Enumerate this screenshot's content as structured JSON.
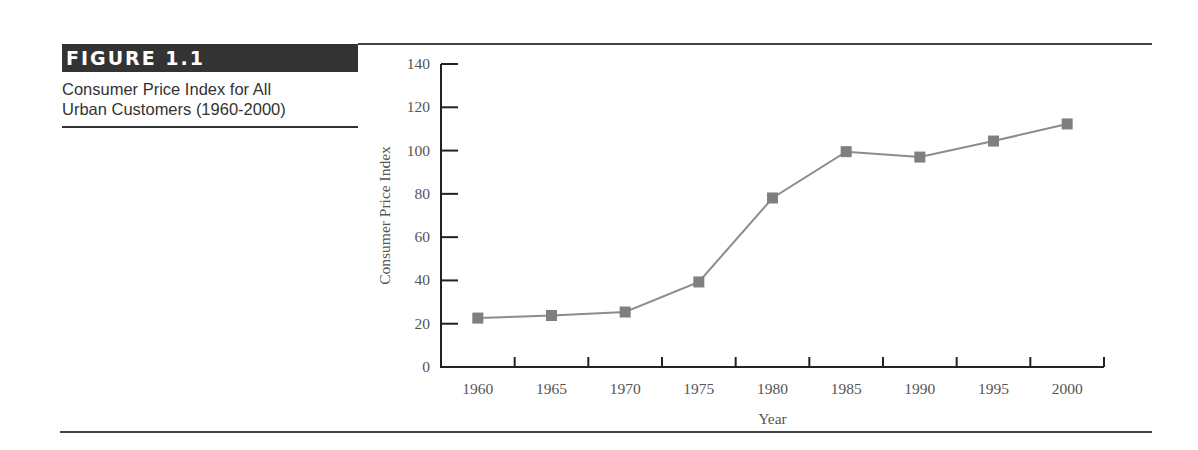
{
  "figure": {
    "label": "FIGURE 1.1",
    "caption_line1": "Consumer Price Index for All",
    "caption_line2": "Urban Customers (1960-2000)"
  },
  "colors": {
    "marker": "#7f7f7f",
    "line": "#8c8c8c",
    "axis": "#222222",
    "label_bar": "#333333"
  },
  "chart_data": {
    "type": "line",
    "title": "Consumer Price Index for All Urban Customers (1960-2000)",
    "xlabel": "Year",
    "ylabel": "Consumer Price Index",
    "categories": [
      "1960",
      "1965",
      "1970",
      "1975",
      "1980",
      "1985",
      "1990",
      "1995",
      "2000"
    ],
    "series": [
      {
        "name": "Consumer Price Index",
        "values": [
          22.6,
          23.8,
          25.4,
          39.3,
          78.1,
          99.5,
          97.0,
          104.4,
          112.3
        ],
        "marker": "square"
      }
    ],
    "ylim": [
      0,
      140
    ],
    "yticks": [
      0,
      20,
      40,
      60,
      80,
      100,
      120,
      140
    ],
    "grid": false,
    "legend": "none"
  }
}
